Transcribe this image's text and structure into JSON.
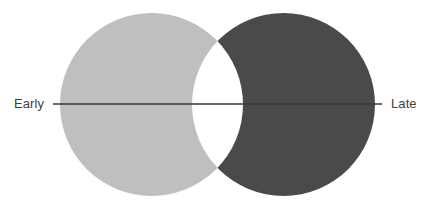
{
  "figure": {
    "type": "venn-crescents",
    "background": "#ffffff",
    "width": 435,
    "height": 208
  },
  "axis": {
    "left_label": "Early",
    "right_label": "Late",
    "line_color": "#3a3a3a",
    "line_y": 104,
    "line_x_start": 53,
    "line_x_end": 382,
    "line_width": 1.4
  },
  "shapes": {
    "left_circle": {
      "name": "early-circle",
      "fill": "#bfbfbf",
      "cx": 151.5,
      "cy": 104.5,
      "r": 91.5
    },
    "right_circle": {
      "name": "late-circle",
      "fill": "#4a4a4a",
      "cx": 283.5,
      "cy": 104.5,
      "r": 91.5
    },
    "overlap": {
      "name": "overlap-lens",
      "fill": "#ffffff",
      "cusp_x": 217.5,
      "cusp_top_y": 48,
      "cusp_bottom_y": 161
    }
  },
  "text_color": "#404040"
}
